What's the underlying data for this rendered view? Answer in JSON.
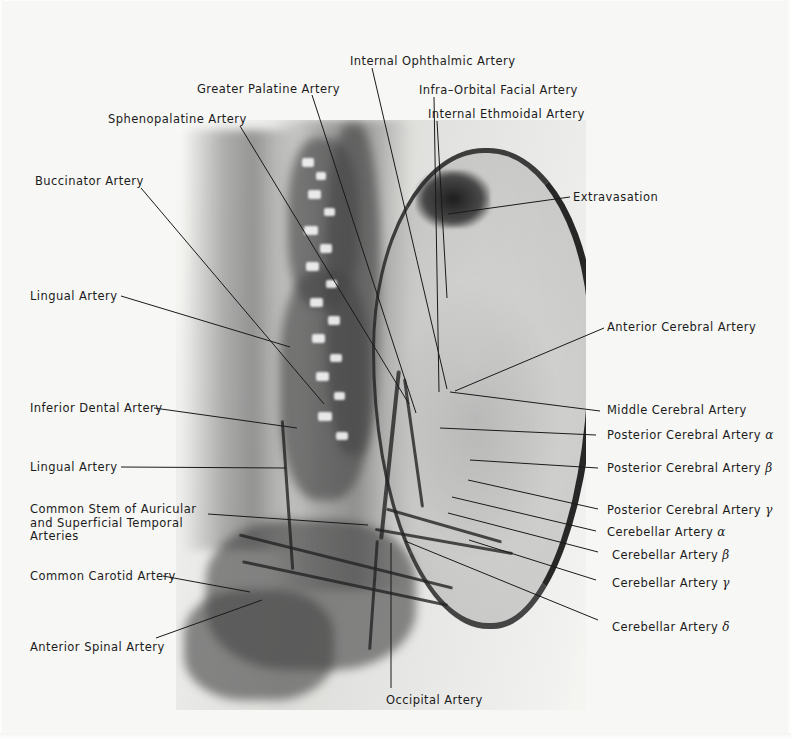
{
  "figure": {
    "kind": "annotated-angiogram",
    "modality": "cerebral and external carotid arteriogram (lateral projection)"
  },
  "labels_top": [
    {
      "id": "internal-ophthalmic-artery",
      "text": "Internal Ophthalmic Artery",
      "x": 350,
      "y": 55,
      "lx": 372,
      "ly": 68,
      "tx": 447,
      "ty": 389
    },
    {
      "id": "greater-palatine-artery",
      "text": "Greater Palatine Artery",
      "x": 197,
      "y": 83,
      "lx": 312,
      "ly": 95,
      "tx": 416,
      "ty": 413
    },
    {
      "id": "infra-orbital-facial-artery",
      "text": "Infra–Orbital Facial Artery",
      "x": 419,
      "y": 84,
      "lx": 434,
      "ly": 97,
      "tx": 439,
      "ty": 392
    },
    {
      "id": "internal-ethmoidal-artery",
      "text": "Internal Ethmoidal Artery",
      "x": 428,
      "y": 108,
      "lx": 437,
      "ly": 121,
      "tx": 447,
      "ty": 298
    },
    {
      "id": "sphenopalatine-artery",
      "text": "Sphenopalatine Artery",
      "x": 108,
      "y": 113,
      "lx": 240,
      "ly": 126,
      "tx": 409,
      "ty": 404
    },
    {
      "id": "buccinator-artery",
      "text": "Buccinator Artery",
      "x": 35,
      "y": 175,
      "lx": 141,
      "ly": 188,
      "tx": 324,
      "ty": 404
    }
  ],
  "labels_left": [
    {
      "id": "lingual-artery-upper",
      "text": "Lingual Artery",
      "x": 30,
      "y": 290,
      "lx": 121,
      "ly": 296,
      "tx": 290,
      "ty": 347
    },
    {
      "id": "inferior-dental-artery",
      "text": "Inferior Dental Artery",
      "x": 30,
      "y": 402,
      "lx": 154,
      "ly": 408,
      "tx": 297,
      "ty": 428
    },
    {
      "id": "lingual-artery-lower",
      "text": "Lingual Artery",
      "x": 30,
      "y": 461,
      "lx": 121,
      "ly": 467,
      "tx": 286,
      "ty": 468
    },
    {
      "id": "common-stem-auricular-superficial-temporal",
      "text": "Common Stem of Auricular and Superficial Temporal Arteries",
      "x": 30,
      "y": 503,
      "lx": 208,
      "ly": 514,
      "tx": 368,
      "ty": 525,
      "multiline": true
    },
    {
      "id": "common-carotid-artery",
      "text": "Common Carotid Artery",
      "x": 30,
      "y": 570,
      "lx": 163,
      "ly": 576,
      "tx": 250,
      "ty": 592
    },
    {
      "id": "anterior-spinal-artery",
      "text": "Anterior Spinal Artery",
      "x": 30,
      "y": 641,
      "lx": 156,
      "ly": 638,
      "tx": 262,
      "ty": 600
    }
  ],
  "labels_right": [
    {
      "id": "extravasation",
      "text": "Extravasation",
      "x": 573,
      "y": 191,
      "lx": 570,
      "ly": 197,
      "tx": 448,
      "ty": 214
    },
    {
      "id": "anterior-cerebral-artery",
      "text": "Anterior Cerebral Artery",
      "x": 607,
      "y": 321,
      "lx": 604,
      "ly": 328,
      "tx": 455,
      "ty": 391
    },
    {
      "id": "middle-cerebral-artery",
      "text": "Middle Cerebral Artery",
      "x": 607,
      "y": 404,
      "lx": 600,
      "ly": 411,
      "tx": 450,
      "ty": 392
    },
    {
      "id": "posterior-cerebral-artery-alpha",
      "text": "Posterior Cerebral Artery ",
      "greek": "α",
      "x": 607,
      "y": 429,
      "lx": 596,
      "ly": 435,
      "tx": 440,
      "ty": 428
    },
    {
      "id": "posterior-cerebral-artery-beta",
      "text": "Posterior Cerebral Artery ",
      "greek": "β",
      "x": 607,
      "y": 462,
      "lx": 598,
      "ly": 468,
      "tx": 470,
      "ty": 460
    },
    {
      "id": "posterior-cerebral-artery-gamma",
      "text": "Posterior Cerebral Artery ",
      "greek": "γ",
      "x": 607,
      "y": 504,
      "lx": 598,
      "ly": 509,
      "tx": 468,
      "ty": 480
    },
    {
      "id": "cerebellar-artery-alpha",
      "text": "Cerebellar Artery ",
      "greek": "α",
      "x": 607,
      "y": 526,
      "lx": 596,
      "ly": 531,
      "tx": 452,
      "ty": 497
    },
    {
      "id": "cerebellar-artery-beta",
      "text": "Cerebellar Artery ",
      "greek": "β",
      "x": 612,
      "y": 549,
      "lx": 598,
      "ly": 552,
      "tx": 448,
      "ty": 513
    },
    {
      "id": "cerebellar-artery-gamma",
      "text": "Cerebellar Artery ",
      "greek": "γ",
      "x": 612,
      "y": 577,
      "lx": 596,
      "ly": 580,
      "tx": 469,
      "ty": 540
    },
    {
      "id": "cerebellar-artery-delta",
      "text": "Cerebellar Artery ",
      "greek": "δ",
      "x": 612,
      "y": 621,
      "lx": 598,
      "ly": 620,
      "tx": 405,
      "ty": 541
    }
  ],
  "labels_bottom": [
    {
      "id": "occipital-artery",
      "text": "Occipital Artery",
      "x": 386,
      "y": 694,
      "lx": 391,
      "ly": 688,
      "tx": 391,
      "ty": 543
    }
  ],
  "colors": {
    "ink": "#1b1b1b",
    "paper": "#f7f7f5",
    "leader": "#1a1a1a"
  }
}
